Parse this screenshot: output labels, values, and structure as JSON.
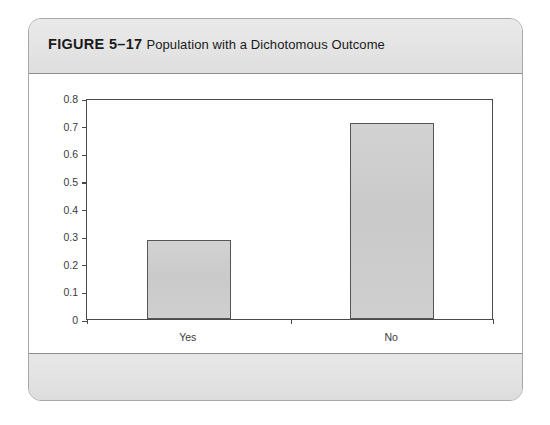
{
  "figure": {
    "number_label": "FIGURE 5–17",
    "caption": "Population with a Dichotomous Outcome"
  },
  "chart_data": {
    "type": "bar",
    "title": "Population with a Dichotomous Outcome",
    "categories": [
      "Yes",
      "No"
    ],
    "values": [
      0.285,
      0.71
    ],
    "xlabel": "",
    "ylabel": "",
    "ylim": [
      0,
      0.8
    ],
    "yticks": [
      0,
      0.1,
      0.2,
      0.3,
      0.4,
      0.5,
      0.6,
      0.7,
      0.8
    ],
    "ytick_labels": [
      "0",
      "0.1",
      "0.2",
      "0.3",
      "0.4",
      "0.5",
      "0.6",
      "0.7",
      "0.8"
    ],
    "grid": false,
    "legend": false,
    "bar_fill_color": "#cdcdcd",
    "bar_edge_color": "#555555",
    "axis_color": "#4a4a4a"
  },
  "style": {
    "header_band_color": "#e4e4e4",
    "footer_band_color": "#e2e2e2",
    "card_border_color": "#a8a8a8"
  }
}
